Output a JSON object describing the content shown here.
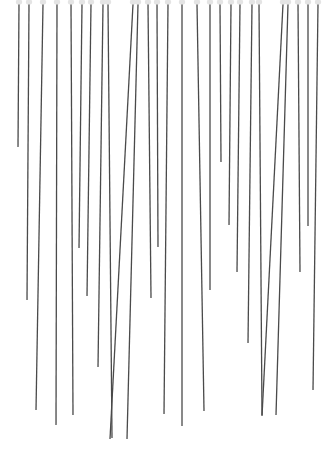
{
  "image": {
    "description": "Photograph of many thin dark pins hanging vertically with small white heads at the top, on a white background",
    "width": 331,
    "height": 453,
    "background": "#ffffff",
    "pin_color": "#4a4a4a",
    "head_color": "#e4e4e4",
    "pins": [
      {
        "x1": 19,
        "x2": 18,
        "y2": 147
      },
      {
        "x1": 29,
        "x2": 27,
        "y2": 300
      },
      {
        "x1": 43,
        "x2": 36,
        "y2": 410
      },
      {
        "x1": 57,
        "x2": 56,
        "y2": 425
      },
      {
        "x1": 71,
        "x2": 73,
        "y2": 415
      },
      {
        "x1": 82,
        "x2": 79,
        "y2": 248
      },
      {
        "x1": 91,
        "x2": 87,
        "y2": 296
      },
      {
        "x1": 103,
        "x2": 98,
        "y2": 367
      },
      {
        "x1": 108,
        "x2": 112,
        "y2": 438
      },
      {
        "x1": 133,
        "x2": 110,
        "y2": 439
      },
      {
        "x1": 138,
        "x2": 127,
        "y2": 439
      },
      {
        "x1": 148,
        "x2": 151,
        "y2": 298
      },
      {
        "x1": 157,
        "x2": 158,
        "y2": 247
      },
      {
        "x1": 168,
        "x2": 164,
        "y2": 414
      },
      {
        "x1": 182,
        "x2": 182,
        "y2": 426
      },
      {
        "x1": 197,
        "x2": 204,
        "y2": 411
      },
      {
        "x1": 210,
        "x2": 210,
        "y2": 290
      },
      {
        "x1": 220,
        "x2": 221,
        "y2": 162
      },
      {
        "x1": 231,
        "x2": 229,
        "y2": 225
      },
      {
        "x1": 240,
        "x2": 237,
        "y2": 272
      },
      {
        "x1": 252,
        "x2": 248,
        "y2": 343
      },
      {
        "x1": 259,
        "x2": 262,
        "y2": 415
      },
      {
        "x1": 283,
        "x2": 262,
        "y2": 416
      },
      {
        "x1": 288,
        "x2": 276,
        "y2": 415
      },
      {
        "x1": 298,
        "x2": 300,
        "y2": 272
      },
      {
        "x1": 308,
        "x2": 308,
        "y2": 226
      },
      {
        "x1": 318,
        "x2": 313,
        "y2": 390
      }
    ]
  }
}
